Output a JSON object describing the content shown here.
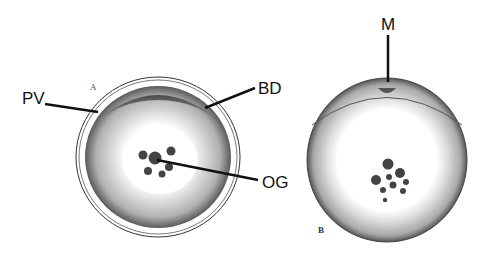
{
  "figure": {
    "panel_a": {
      "panel_letter": "A",
      "labels": [
        {
          "id": "pv",
          "text": "PV"
        },
        {
          "id": "bd",
          "text": "BD"
        },
        {
          "id": "og",
          "text": "OG"
        }
      ]
    },
    "panel_b": {
      "panel_letter": "B",
      "labels": [
        {
          "id": "m",
          "text": "M"
        }
      ]
    },
    "colors": {
      "ink": "#111111",
      "background": "#ffffff",
      "cytoplasm_dark": "#3a3a3a",
      "cytoplasm_light": "#d8d8d8"
    }
  }
}
